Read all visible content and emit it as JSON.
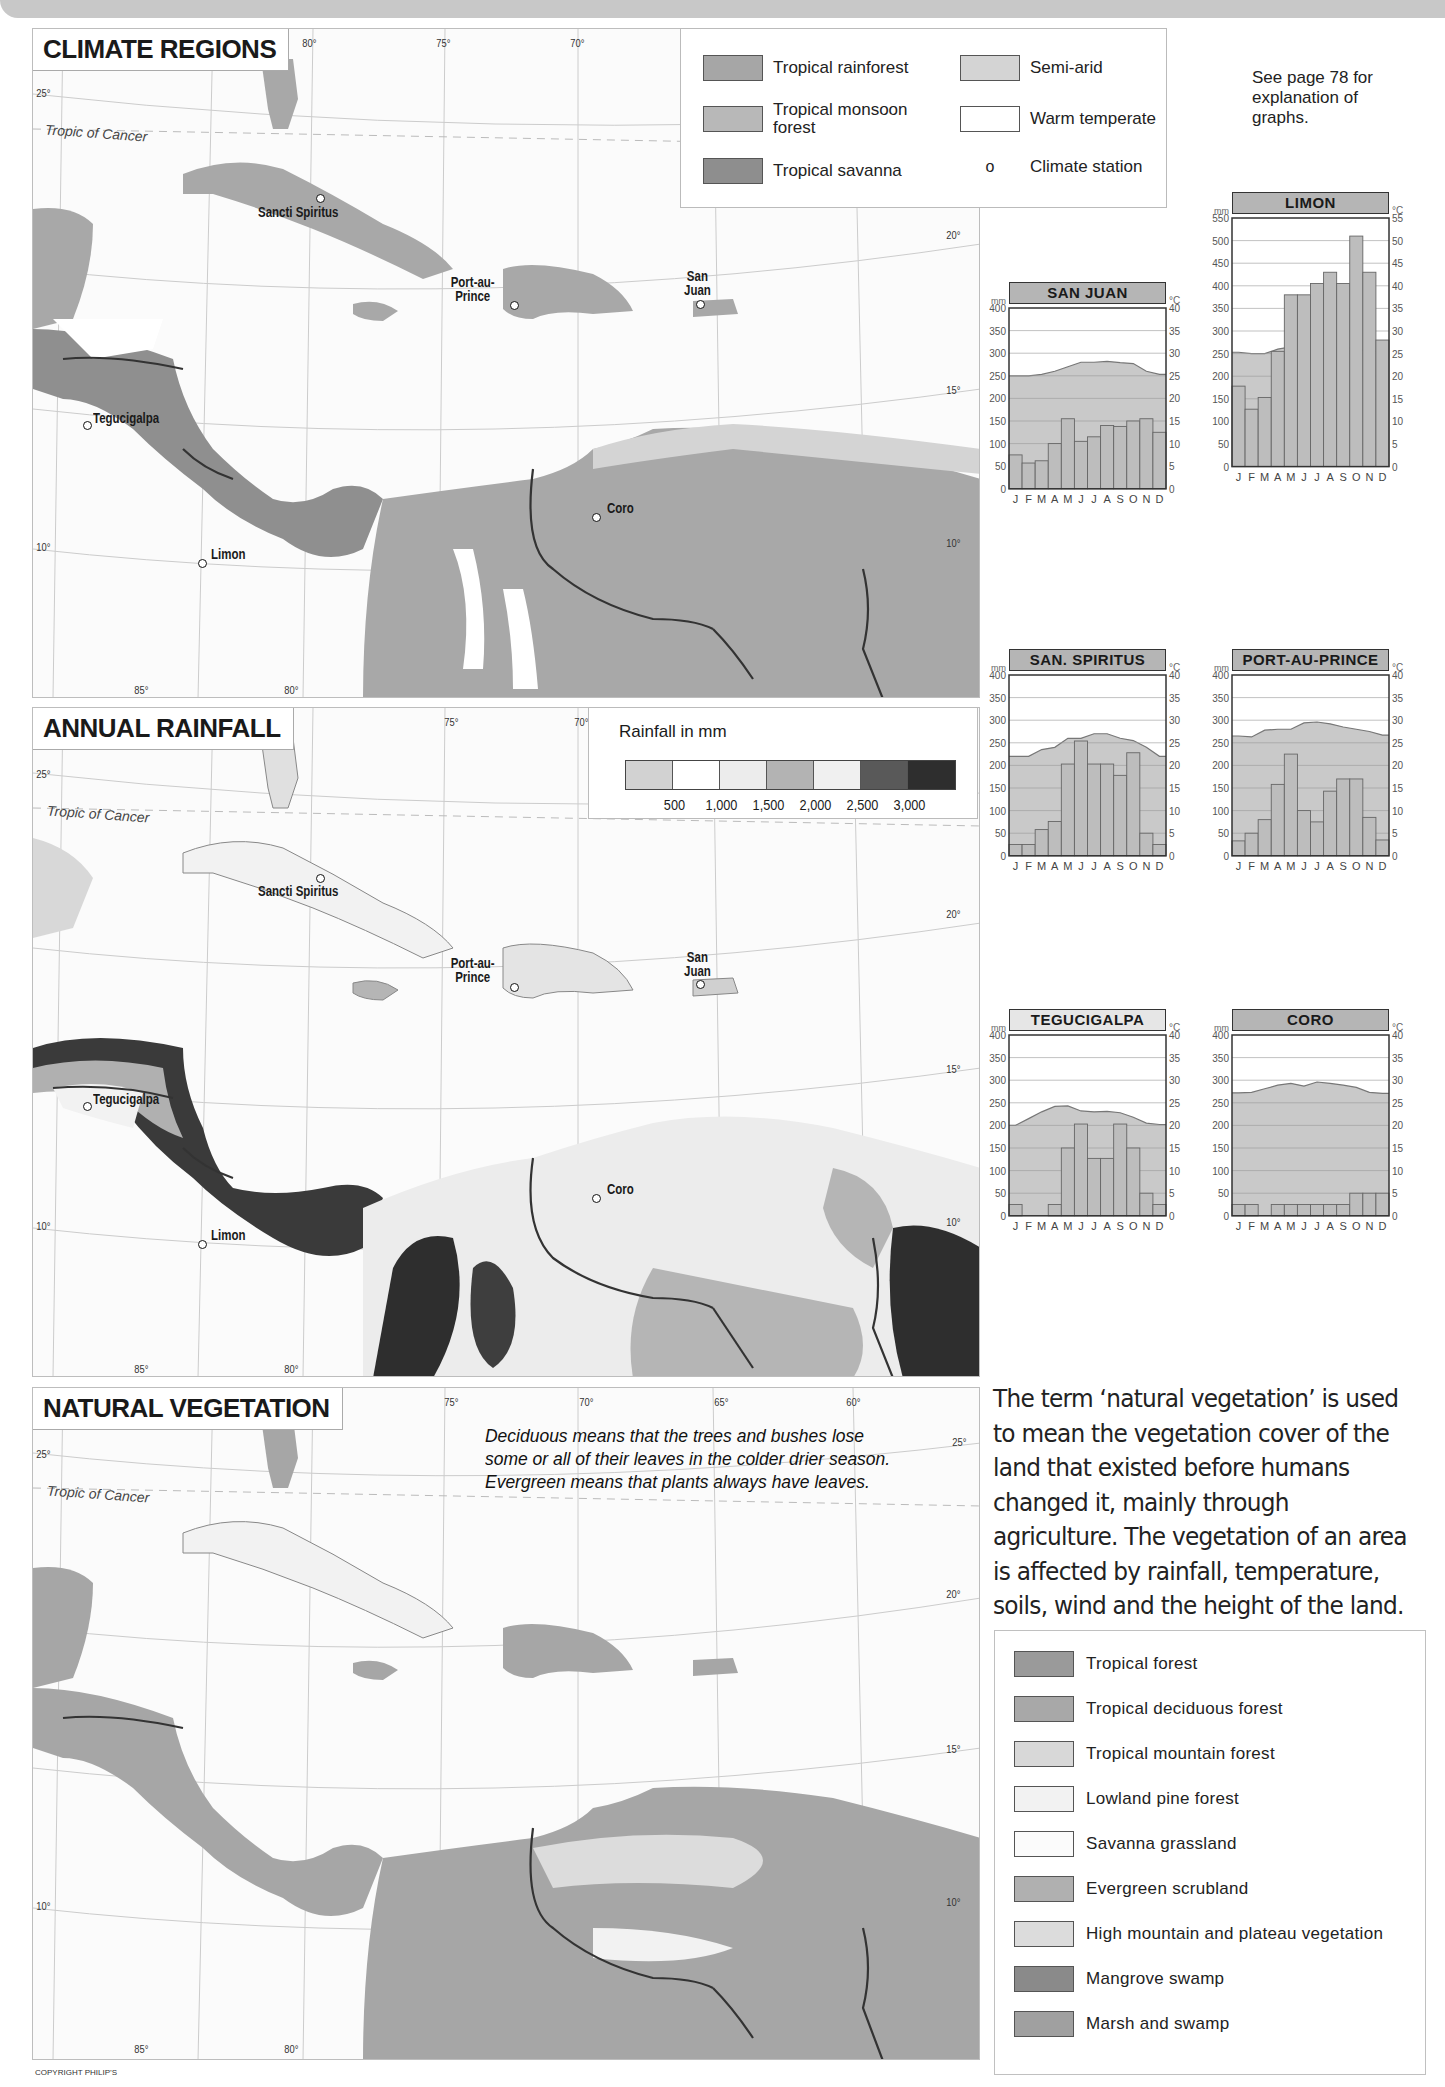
{
  "maps": {
    "climate": {
      "title": "CLIMATE REGIONS",
      "legend": {
        "items": [
          {
            "label": "Tropical rainforest",
            "color": "#a6a6a6"
          },
          {
            "label": "Tropical monsoon forest",
            "color": "#b8b8b8"
          },
          {
            "label": "Tropical savanna",
            "color": "#8e8e8e"
          },
          {
            "label": "Semi-arid",
            "color": "#d4d4d4"
          },
          {
            "label": "Warm temperate",
            "color": "#ffffff"
          },
          {
            "label": "Climate station",
            "symbol": "o"
          }
        ]
      }
    },
    "rainfall": {
      "title": "ANNUAL RAINFALL",
      "legend": {
        "title": "Rainfall in mm",
        "bins": [
          {
            "color": "#d2d2d2"
          },
          {
            "color": "#ffffff"
          },
          {
            "color": "#ececec"
          },
          {
            "color": "#b3b3b3"
          },
          {
            "color": "#f0f0f0"
          },
          {
            "color": "#595959"
          },
          {
            "color": "#2e2e2e"
          }
        ],
        "labels": [
          "500",
          "1,000",
          "1,500",
          "2,000",
          "2,500",
          "3,000"
        ]
      }
    },
    "vegetation": {
      "title": "NATURAL VEGETATION",
      "note": "Deciduous means that the trees and bushes lose some or all of their leaves in the colder drier season. Evergreen means that plants always have leaves.",
      "legend": {
        "items": [
          {
            "label": "Tropical forest",
            "color": "#9a9a9a"
          },
          {
            "label": "Tropical deciduous forest",
            "color": "#a8a8a8"
          },
          {
            "label": "Tropical mountain forest",
            "color": "#d8d8d8"
          },
          {
            "label": "Lowland pine forest",
            "color": "#f2f2f2"
          },
          {
            "label": "Savanna grassland",
            "color": "#fbfbfb"
          },
          {
            "label": "Evergreen scrubland",
            "color": "#b0b0b0"
          },
          {
            "label": "High mountain and plateau vegetation",
            "color": "#dcdcdc"
          },
          {
            "label": "Mangrove swamp",
            "color": "#8a8a8a"
          },
          {
            "label": "Marsh and swamp",
            "color": "#a0a0a0"
          }
        ]
      }
    },
    "labels": {
      "tropic": "Tropic of Cancer",
      "lon": [
        "85°",
        "80°",
        "75°",
        "70°",
        "65°",
        "60°"
      ],
      "lat": [
        "25°",
        "20°",
        "15°",
        "10°"
      ],
      "cities": [
        "Sancti Spiritus",
        "Port-au-Prince",
        "San Juan",
        "Tegucigalpa",
        "Limon",
        "Coro"
      ]
    }
  },
  "graphs_note": "See page 78 for explanation of graphs.",
  "intro_text": "The term ‘natural vegetation’ is used to mean the vegetation cover of the land that existed before humans changed it, mainly through agriculture. The vegetation of an area is affected by rainfall, temperature, soils, wind and the height of the land.",
  "copyright": "COPYRIGHT PHILIP’S",
  "chart_data": [
    {
      "type": "bar",
      "title": "SAN JUAN",
      "categories": [
        "J",
        "F",
        "M",
        "A",
        "M",
        "J",
        "J",
        "A",
        "S",
        "O",
        "N",
        "D"
      ],
      "series": [
        {
          "name": "Rainfall (mm)",
          "type": "bar",
          "values": [
            75,
            57,
            62,
            100,
            155,
            105,
            115,
            140,
            138,
            150,
            155,
            125
          ]
        },
        {
          "name": "Temperature (°C)",
          "type": "area",
          "values": [
            25,
            25,
            25.3,
            26,
            27,
            28,
            28,
            28.2,
            27.9,
            27.7,
            26,
            25.3
          ]
        }
      ],
      "ylabel": "mm",
      "y2label": "°C",
      "ylim": [
        0,
        400
      ],
      "y2lim": [
        0,
        40
      ]
    },
    {
      "type": "bar",
      "title": "LIMON",
      "categories": [
        "J",
        "F",
        "M",
        "A",
        "M",
        "J",
        "J",
        "A",
        "S",
        "O",
        "N",
        "D"
      ],
      "series": [
        {
          "name": "Rainfall (mm)",
          "type": "bar",
          "values": [
            178,
            127,
            153,
            255,
            380,
            380,
            405,
            430,
            405,
            510,
            430,
            280
          ]
        },
        {
          "name": "Temperature (°C)",
          "type": "area",
          "values": [
            25.3,
            25,
            25,
            26,
            26.5,
            26.3,
            26.4,
            26,
            26.5,
            26,
            25.6,
            25.4
          ]
        }
      ],
      "ylabel": "mm",
      "y2label": "°C",
      "ylim": [
        0,
        550
      ],
      "y2lim": [
        0,
        55
      ]
    },
    {
      "type": "bar",
      "title": "SAN. SPIRITUS",
      "categories": [
        "J",
        "F",
        "M",
        "A",
        "M",
        "J",
        "J",
        "A",
        "S",
        "O",
        "N",
        "D"
      ],
      "series": [
        {
          "name": "Rainfall (mm)",
          "type": "bar",
          "values": [
            25,
            25,
            58,
            76,
            203,
            254,
            203,
            203,
            178,
            228,
            50,
            25
          ]
        },
        {
          "name": "Temperature (°C)",
          "type": "area",
          "values": [
            22,
            22,
            23.5,
            24,
            26,
            26,
            27,
            27,
            26,
            25.5,
            24,
            22
          ]
        }
      ],
      "ylabel": "mm",
      "y2label": "°C",
      "ylim": [
        0,
        400
      ],
      "y2lim": [
        0,
        40
      ]
    },
    {
      "type": "bar",
      "title": "PORT-AU-PRINCE",
      "categories": [
        "J",
        "F",
        "M",
        "A",
        "M",
        "J",
        "J",
        "A",
        "S",
        "O",
        "N",
        "D"
      ],
      "series": [
        {
          "name": "Rainfall (mm)",
          "type": "bar",
          "values": [
            33,
            50,
            80,
            158,
            225,
            100,
            75,
            143,
            170,
            170,
            85,
            35
          ]
        },
        {
          "name": "Temperature (°C)",
          "type": "area",
          "values": [
            26.5,
            26.3,
            27.8,
            28,
            28,
            29.4,
            29.6,
            29.2,
            28.5,
            28,
            27.5,
            26.7
          ]
        }
      ],
      "ylabel": "mm",
      "y2label": "°C",
      "ylim": [
        0,
        400
      ],
      "y2lim": [
        0,
        40
      ]
    },
    {
      "type": "bar",
      "title": "TEGUCIGALPA",
      "categories": [
        "J",
        "F",
        "M",
        "A",
        "M",
        "J",
        "J",
        "A",
        "S",
        "O",
        "N",
        "D"
      ],
      "series": [
        {
          "name": "Rainfall (mm)",
          "type": "bar",
          "values": [
            25,
            0,
            0,
            25,
            150,
            203,
            127,
            127,
            203,
            150,
            50,
            25
          ]
        },
        {
          "name": "Temperature (°C)",
          "type": "area",
          "values": [
            20,
            21.5,
            23,
            24.2,
            24.3,
            23.2,
            23,
            23.1,
            22.8,
            21.8,
            20.5,
            20.2
          ]
        }
      ],
      "ylabel": "mm",
      "y2label": "°C",
      "ylim": [
        0,
        400
      ],
      "y2lim": [
        0,
        40
      ]
    },
    {
      "type": "bar",
      "title": "CORO",
      "categories": [
        "J",
        "F",
        "M",
        "A",
        "M",
        "J",
        "J",
        "A",
        "S",
        "O",
        "N",
        "D"
      ],
      "series": [
        {
          "name": "Rainfall (mm)",
          "type": "bar",
          "values": [
            25,
            25,
            0,
            25,
            25,
            25,
            25,
            25,
            25,
            50,
            50,
            50
          ]
        },
        {
          "name": "Temperature (°C)",
          "type": "area",
          "values": [
            27.2,
            27.3,
            28.1,
            28.9,
            29.3,
            28.7,
            29.6,
            29.3,
            28.9,
            28.4,
            27.3,
            27.1
          ]
        }
      ],
      "ylabel": "mm",
      "y2label": "°C",
      "ylim": [
        0,
        400
      ],
      "y2lim": [
        0,
        40
      ]
    }
  ]
}
